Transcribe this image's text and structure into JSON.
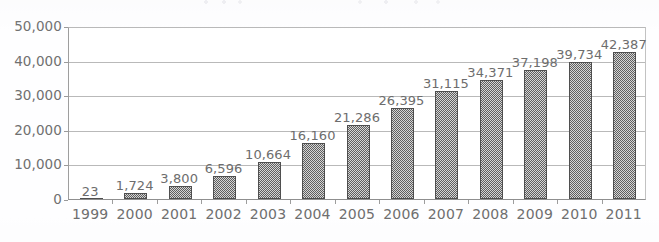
{
  "chart_data": {
    "type": "bar",
    "title": "",
    "xlabel": "",
    "ylabel": "",
    "categories": [
      "1999",
      "2000",
      "2001",
      "2002",
      "2003",
      "2004",
      "2005",
      "2006",
      "2007",
      "2008",
      "2009",
      "2010",
      "2011"
    ],
    "values": [
      23,
      1724,
      3800,
      6596,
      10664,
      16160,
      21286,
      26395,
      31115,
      34371,
      37198,
      39734,
      42387
    ],
    "value_labels": [
      "23",
      "1,724",
      "3,800",
      "6,596",
      "10,664",
      "16,160",
      "21,286",
      "26,395",
      "31,115",
      "34,371",
      "37,198",
      "39,734",
      "42,387"
    ],
    "ylim": [
      0,
      50000
    ],
    "ytick_values": [
      0,
      10000,
      20000,
      30000,
      40000,
      50000
    ],
    "ytick_labels": [
      "0",
      "10,000",
      "20,000",
      "30,000",
      "40,000",
      "50,000"
    ],
    "grid": true,
    "legend": "none",
    "series_name": "",
    "bar_fill": "gray checkered hatch",
    "colors": {
      "bar_fill": "#a8a8a8",
      "bar_outline": "#4f4f4f",
      "gridline": "#b9b9b9",
      "axis": "#8f8f8f",
      "text": "#6e6e6e",
      "background": "#ffffff"
    }
  },
  "axes": {
    "y_ticks": [
      {
        "label": "50,000",
        "value": 50000
      },
      {
        "label": "40,000",
        "value": 40000
      },
      {
        "label": "30,000",
        "value": 30000
      },
      {
        "label": "20,000",
        "value": 20000
      },
      {
        "label": "10,000",
        "value": 10000
      },
      {
        "label": "0",
        "value": 0
      }
    ],
    "x_ticks": [
      {
        "label": "1999"
      },
      {
        "label": "2000"
      },
      {
        "label": "2001"
      },
      {
        "label": "2002"
      },
      {
        "label": "2003"
      },
      {
        "label": "2004"
      },
      {
        "label": "2005"
      },
      {
        "label": "2006"
      },
      {
        "label": "2007"
      },
      {
        "label": "2008"
      },
      {
        "label": "2009"
      },
      {
        "label": "2010"
      },
      {
        "label": "2011"
      }
    ]
  }
}
